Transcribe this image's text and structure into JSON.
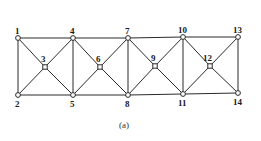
{
  "diagram": {
    "type": "truss",
    "caption": "(a)",
    "nodes": [
      {
        "id": "1",
        "x": 18,
        "y": 38,
        "shape": "circle",
        "label_dx": -3,
        "label_dy": -4
      },
      {
        "id": "2",
        "x": 18,
        "y": 95,
        "shape": "circle",
        "label_dx": -3,
        "label_dy": 12
      },
      {
        "id": "3",
        "x": 45,
        "y": 67,
        "shape": "square",
        "label_dx": -4,
        "label_dy": -5
      },
      {
        "id": "4",
        "x": 73,
        "y": 38,
        "shape": "circle",
        "label_dx": -3,
        "label_dy": -4
      },
      {
        "id": "5",
        "x": 73,
        "y": 95,
        "shape": "circle",
        "label_dx": -3,
        "label_dy": 12
      },
      {
        "id": "6",
        "x": 100,
        "y": 67,
        "shape": "square",
        "label_dx": -4,
        "label_dy": -5
      },
      {
        "id": "7",
        "x": 128,
        "y": 38,
        "shape": "circle",
        "label_dx": -3,
        "label_dy": -4
      },
      {
        "id": "8",
        "x": 128,
        "y": 95,
        "shape": "circle",
        "label_dx": -3,
        "label_dy": 12
      },
      {
        "id": "9",
        "x": 155,
        "y": 66,
        "shape": "square",
        "label_dx": -4,
        "label_dy": -5
      },
      {
        "id": "10",
        "x": 183,
        "y": 37,
        "shape": "circle",
        "label_dx": -5,
        "label_dy": -4
      },
      {
        "id": "11",
        "x": 183,
        "y": 94,
        "shape": "circle",
        "label_dx": -5,
        "label_dy": 12
      },
      {
        "id": "12",
        "x": 210,
        "y": 66,
        "shape": "square",
        "label_dx": -7,
        "label_dy": -5
      },
      {
        "id": "13",
        "x": 238,
        "y": 37,
        "shape": "circle",
        "label_dx": -5,
        "label_dy": -4
      },
      {
        "id": "14",
        "x": 238,
        "y": 93,
        "shape": "circle",
        "label_dx": -5,
        "label_dy": 12
      }
    ],
    "members": [
      [
        "1",
        "4"
      ],
      [
        "4",
        "7"
      ],
      [
        "7",
        "10"
      ],
      [
        "10",
        "13"
      ],
      [
        "2",
        "5"
      ],
      [
        "5",
        "8"
      ],
      [
        "8",
        "11"
      ],
      [
        "11",
        "14"
      ],
      [
        "1",
        "2"
      ],
      [
        "4",
        "5"
      ],
      [
        "7",
        "8"
      ],
      [
        "10",
        "11"
      ],
      [
        "13",
        "14"
      ],
      [
        "1",
        "3"
      ],
      [
        "3",
        "5"
      ],
      [
        "2",
        "3"
      ],
      [
        "3",
        "4"
      ],
      [
        "4",
        "6"
      ],
      [
        "6",
        "8"
      ],
      [
        "5",
        "6"
      ],
      [
        "6",
        "7"
      ],
      [
        "7",
        "9"
      ],
      [
        "9",
        "11"
      ],
      [
        "8",
        "9"
      ],
      [
        "9",
        "10"
      ],
      [
        "10",
        "12"
      ],
      [
        "12",
        "14"
      ],
      [
        "11",
        "12"
      ],
      [
        "12",
        "13"
      ]
    ]
  }
}
